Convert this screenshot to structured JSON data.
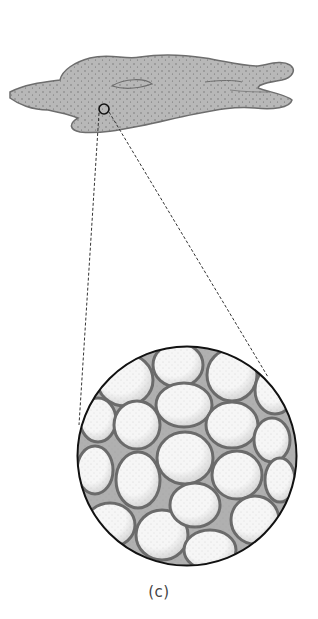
{
  "figure": {
    "caption": "(c)",
    "colors": {
      "tissue_fill": "#b8b8b8",
      "tissue_outline": "#6e6e6e",
      "stipple": "#5a5a5a",
      "cell_fill": "#f4f4f4",
      "cell_outline": "#6a6a6a",
      "intercellular_fill": "#b0b0b0",
      "circle_outline": "#111111",
      "dashed_line": "#333333"
    },
    "magnifier": {
      "small_circle": {
        "cx": 104,
        "cy": 109,
        "r": 5
      },
      "large_circle": {
        "cx": 187,
        "cy": 456,
        "r": 110
      }
    }
  }
}
